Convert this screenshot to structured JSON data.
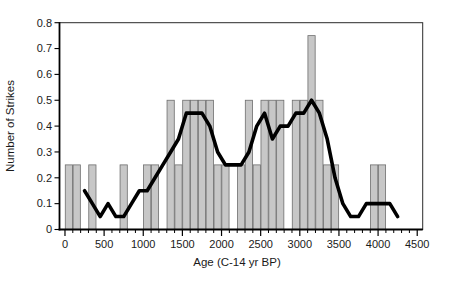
{
  "figure": {
    "background": "#ffffff"
  },
  "chart_data": {
    "type": "bar",
    "title": "",
    "xlabel": "Age (C-14 yr BP)",
    "ylabel": "Number of Strikes",
    "xlim": [
      -70,
      4570
    ],
    "ylim": [
      0,
      0.8
    ],
    "x_major_ticks": [
      0,
      500,
      1000,
      1500,
      2000,
      2500,
      3000,
      3500,
      4000,
      4500
    ],
    "x_minor_step": 100,
    "y_ticks": [
      0,
      0.1,
      0.2,
      0.3,
      0.4,
      0.5,
      0.6,
      0.7,
      0.8
    ],
    "grid": "off",
    "legend": "none",
    "bin_width": 100,
    "bars": [
      {
        "start": 0,
        "value": 0.25
      },
      {
        "start": 100,
        "value": 0.25
      },
      {
        "start": 300,
        "value": 0.25
      },
      {
        "start": 700,
        "value": 0.25
      },
      {
        "start": 1000,
        "value": 0.25
      },
      {
        "start": 1100,
        "value": 0.25
      },
      {
        "start": 1300,
        "value": 0.5
      },
      {
        "start": 1400,
        "value": 0.25
      },
      {
        "start": 1500,
        "value": 0.5
      },
      {
        "start": 1600,
        "value": 0.5
      },
      {
        "start": 1700,
        "value": 0.5
      },
      {
        "start": 1800,
        "value": 0.5
      },
      {
        "start": 1900,
        "value": 0.25
      },
      {
        "start": 2000,
        "value": 0.25
      },
      {
        "start": 2200,
        "value": 0.25
      },
      {
        "start": 2300,
        "value": 0.5
      },
      {
        "start": 2400,
        "value": 0.25
      },
      {
        "start": 2500,
        "value": 0.5
      },
      {
        "start": 2600,
        "value": 0.5
      },
      {
        "start": 2700,
        "value": 0.5
      },
      {
        "start": 2900,
        "value": 0.5
      },
      {
        "start": 3000,
        "value": 0.5
      },
      {
        "start": 3100,
        "value": 0.75
      },
      {
        "start": 3200,
        "value": 0.5
      },
      {
        "start": 3300,
        "value": 0.25
      },
      {
        "start": 3400,
        "value": 0.25
      },
      {
        "start": 3900,
        "value": 0.25
      },
      {
        "start": 4000,
        "value": 0.25
      }
    ],
    "line_series": {
      "points": [
        [
          250,
          0.15
        ],
        [
          350,
          0.1
        ],
        [
          450,
          0.05
        ],
        [
          550,
          0.1
        ],
        [
          650,
          0.05
        ],
        [
          750,
          0.05
        ],
        [
          850,
          0.1
        ],
        [
          950,
          0.15
        ],
        [
          1050,
          0.15
        ],
        [
          1150,
          0.2
        ],
        [
          1250,
          0.25
        ],
        [
          1350,
          0.3
        ],
        [
          1450,
          0.35
        ],
        [
          1550,
          0.45
        ],
        [
          1650,
          0.45
        ],
        [
          1750,
          0.45
        ],
        [
          1850,
          0.4
        ],
        [
          1950,
          0.3
        ],
        [
          2050,
          0.25
        ],
        [
          2150,
          0.25
        ],
        [
          2250,
          0.25
        ],
        [
          2350,
          0.3
        ],
        [
          2450,
          0.4
        ],
        [
          2550,
          0.45
        ],
        [
          2650,
          0.35
        ],
        [
          2750,
          0.4
        ],
        [
          2850,
          0.4
        ],
        [
          2950,
          0.45
        ],
        [
          3050,
          0.45
        ],
        [
          3150,
          0.5
        ],
        [
          3250,
          0.45
        ],
        [
          3350,
          0.35
        ],
        [
          3450,
          0.2
        ],
        [
          3550,
          0.1
        ],
        [
          3650,
          0.05
        ],
        [
          3750,
          0.05
        ],
        [
          3850,
          0.1
        ],
        [
          3950,
          0.1
        ],
        [
          4050,
          0.1
        ],
        [
          4150,
          0.1
        ],
        [
          4250,
          0.05
        ]
      ]
    },
    "colors": {
      "bar_fill": "#c7c7c7",
      "bar_stroke": "#6e6e6e",
      "line": "#000000",
      "axis": "#000000",
      "frame": "#2b2b2b",
      "text": "#1a1a1a"
    }
  }
}
